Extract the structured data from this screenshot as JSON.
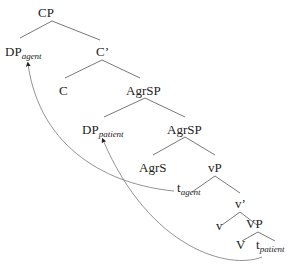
{
  "diagram": {
    "type": "syntax-tree",
    "nodes": {
      "cp": {
        "label": "CP"
      },
      "dp_agent": {
        "label": "DP",
        "sub": "agent"
      },
      "c_bar": {
        "label": "C’"
      },
      "c": {
        "label": "C"
      },
      "agrsp1": {
        "label": "AgrSP"
      },
      "dp_patient": {
        "label": "DP",
        "sub": "patient"
      },
      "agrsp2": {
        "label": "AgrSP"
      },
      "agrs": {
        "label": "AgrS"
      },
      "vp_little": {
        "label": "vP"
      },
      "t_agent": {
        "label": "t",
        "sub": "agent"
      },
      "v_bar": {
        "label": "v’"
      },
      "v": {
        "label": "v"
      },
      "vp": {
        "label": "VP"
      },
      "verb": {
        "label": "V"
      },
      "t_patient": {
        "label": "t",
        "sub": "patient"
      }
    },
    "movement_arrows": [
      {
        "from": "t_agent",
        "to": "dp_agent"
      },
      {
        "from": "t_patient",
        "to": "dp_patient"
      }
    ]
  }
}
